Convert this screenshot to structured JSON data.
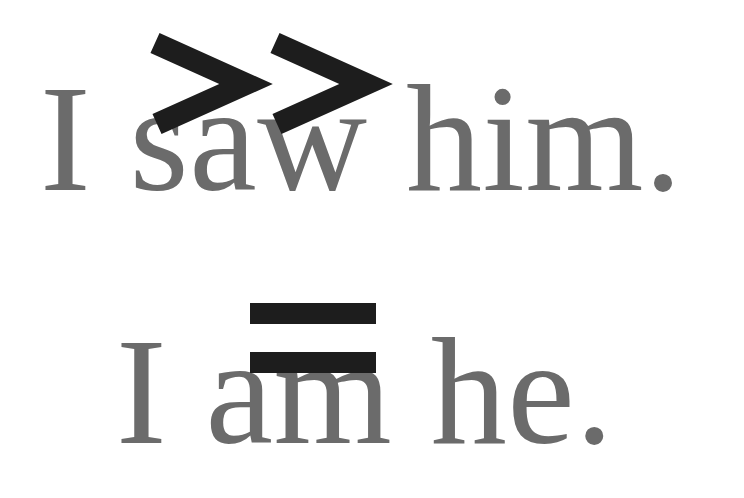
{
  "page": {
    "background_color": "#ffffff",
    "width": 744,
    "height": 498
  },
  "typography": {
    "text_color": "#6b6b6b",
    "overlay_color": "#1d1d1d"
  },
  "lines": [
    {
      "id": "line-1",
      "text": "I saw him.",
      "words": [
        "I",
        "saw",
        "him."
      ],
      "color": "#6b6b6b",
      "overlay": "double-greater-than"
    },
    {
      "id": "line-2",
      "text": "I am he.",
      "words": [
        "I",
        "am",
        "he."
      ],
      "color": "#6b6b6b",
      "overlay": "equals"
    }
  ],
  "overlays": {
    "chevrons": {
      "symbol": ">>",
      "name": "double-greater-than-symbol",
      "color": "#1d1d1d",
      "count": 2
    },
    "equals": {
      "symbol": "=",
      "name": "equals-symbol",
      "color": "#1d1d1d",
      "bars": 2
    }
  },
  "caption": "I saw him.  I am he."
}
